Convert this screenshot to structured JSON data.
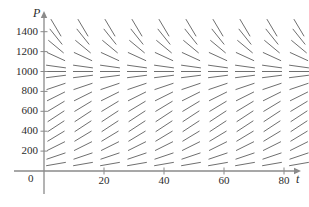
{
  "figure": {
    "kind": "slope-field",
    "width": 309,
    "height": 207,
    "background": "#ffffff",
    "stroke_color": "#6f6f6f",
    "axis_color": "#8a8a8a",
    "text_color": "#2b2b2b"
  },
  "axes": {
    "y_axis_name": "P",
    "x_axis_name": "t",
    "origin_label": "0",
    "y_ticks": [
      200,
      400,
      600,
      800,
      1000,
      1200,
      1400
    ],
    "y_tick_labels": [
      "200",
      "400",
      "600",
      "800",
      "1000",
      "1200",
      "1400"
    ],
    "x_ticks": [
      20,
      40,
      60,
      80
    ],
    "x_tick_labels": [
      "20",
      "40",
      "60",
      "80"
    ],
    "xlim": [
      0,
      88
    ],
    "ylim": [
      0,
      1500
    ]
  },
  "chart_data": {
    "type": "scatter",
    "title": "",
    "xlabel": "t",
    "ylabel": "P",
    "grid": false,
    "legend": "none",
    "xlim": [
      0,
      88
    ],
    "ylim": [
      0,
      1500
    ],
    "x_ticks": [
      20,
      40,
      60,
      80
    ],
    "y_ticks": [
      200,
      400,
      600,
      800,
      1000,
      1200,
      1400
    ],
    "equilibrium_P": 1000,
    "carrying_capacity": 1000,
    "k": 8e-05,
    "t_columns": [
      4,
      13,
      22,
      31,
      40,
      49,
      58,
      67,
      76,
      85
    ],
    "P_rows": [
      70,
      150,
      250,
      350,
      450,
      550,
      650,
      750,
      850,
      950,
      1000,
      1050,
      1150,
      1250,
      1350,
      1440
    ],
    "segment_len_px": 20,
    "slopes_dPdt": [
      {
        "P": 70,
        "slope": 5.21
      },
      {
        "P": 150,
        "slope": 10.2
      },
      {
        "P": 250,
        "slope": 15.0
      },
      {
        "P": 350,
        "slope": 18.2
      },
      {
        "P": 450,
        "slope": 19.8
      },
      {
        "P": 550,
        "slope": 19.8
      },
      {
        "P": 650,
        "slope": 18.2
      },
      {
        "P": 750,
        "slope": 15.0
      },
      {
        "P": 850,
        "slope": 10.2
      },
      {
        "P": 950,
        "slope": 3.8
      },
      {
        "P": 1000,
        "slope": 0.0
      },
      {
        "P": 1050,
        "slope": -4.2
      },
      {
        "P": 1150,
        "slope": -13.8
      },
      {
        "P": 1250,
        "slope": -25.0
      },
      {
        "P": 1350,
        "slope": -37.8
      },
      {
        "P": 1440,
        "slope": -50.7
      }
    ]
  }
}
